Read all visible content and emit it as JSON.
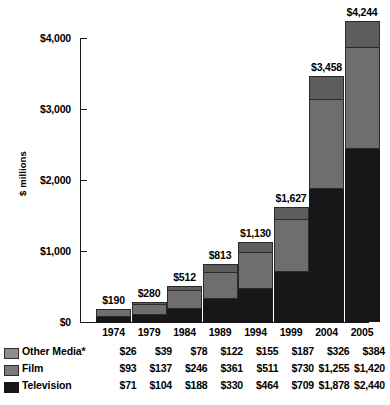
{
  "chart_data": {
    "type": "bar",
    "subtype": "stacked-vertical",
    "title": "",
    "xlabel": "",
    "ylabel": "$ millions",
    "ylim": [
      0,
      4000
    ],
    "yticks": [
      0,
      1000,
      2000,
      3000,
      4000
    ],
    "ytick_labels": [
      "$0",
      "$1,000",
      "$2,000",
      "$3,000",
      "$4,000"
    ],
    "grid": false,
    "legend_position": "below-left",
    "categories": [
      "1974",
      "1979",
      "1984",
      "1989",
      "1994",
      "1999",
      "2004",
      "2005"
    ],
    "series": [
      {
        "name": "Television",
        "color": "#17171a",
        "values": [
          71,
          104,
          188,
          330,
          464,
          709,
          1878,
          2440
        ],
        "labels": [
          "$71",
          "$104",
          "$188",
          "$330",
          "$464",
          "$709",
          "$1,878",
          "$2,440"
        ]
      },
      {
        "name": "Film",
        "color": "#6e6e6e",
        "values": [
          93,
          137,
          246,
          361,
          511,
          730,
          1255,
          1420
        ],
        "labels": [
          "$93",
          "$137",
          "$246",
          "$361",
          "$511",
          "$730",
          "$1,255",
          "$1,420"
        ]
      },
      {
        "name": "Other Media*",
        "color": "#5d5d5d",
        "values": [
          26,
          39,
          78,
          122,
          155,
          187,
          326,
          384
        ],
        "labels": [
          "$26",
          "$39",
          "$78",
          "$122",
          "$155",
          "$187",
          "$326",
          "$384"
        ]
      }
    ],
    "totals": [
      190,
      280,
      512,
      813,
      1130,
      1627,
      3458,
      4244
    ],
    "total_labels": [
      "$190",
      "$280",
      "$512",
      "$813",
      "$1,130",
      "$1,627",
      "$3,458",
      "$4,244"
    ]
  },
  "axis": {
    "y_title": "$ millions"
  },
  "table": {
    "row_labels": [
      "Other Media*",
      "Film",
      "Television"
    ]
  },
  "footnote": {
    "text": ""
  }
}
